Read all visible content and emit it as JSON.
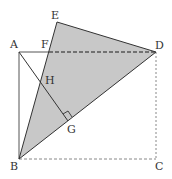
{
  "diagram": {
    "type": "geometry",
    "colors": {
      "fill": "#c8c8c8",
      "stroke": "#333333",
      "dashed": "#555555"
    },
    "points": {
      "A": {
        "label": "A",
        "x": 19,
        "y": 52
      },
      "B": {
        "label": "B",
        "x": 19,
        "y": 159
      },
      "C": {
        "label": "C",
        "x": 156,
        "y": 159
      },
      "D": {
        "label": "D",
        "x": 156,
        "y": 52
      },
      "E": {
        "label": "E",
        "x": 57,
        "y": 22
      },
      "F": {
        "label": "F",
        "x": 49,
        "y": 52
      },
      "G": {
        "label": "G",
        "x": 68,
        "y": 121
      },
      "H": {
        "label": "H",
        "x": 42,
        "y": 80
      }
    },
    "labels": {
      "A": "A",
      "B": "B",
      "C": "C",
      "D": "D",
      "E": "E",
      "F": "F",
      "G": "G",
      "H": "H"
    },
    "shaded_polygon": [
      "B",
      "E",
      "D"
    ],
    "solid_segments": [
      [
        "A",
        "F"
      ],
      [
        "A",
        "B"
      ],
      [
        "B",
        "E"
      ],
      [
        "E",
        "D"
      ],
      [
        "D",
        "B"
      ],
      [
        "A",
        "G"
      ]
    ],
    "dashed_segments": [
      [
        "F",
        "D"
      ],
      [
        "D",
        "C"
      ],
      [
        "B",
        "C"
      ]
    ],
    "right_angle_at": "G"
  }
}
